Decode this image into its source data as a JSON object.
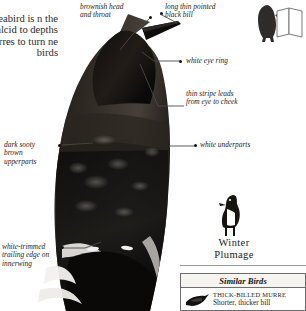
{
  "page": {
    "background": "#ffffff",
    "ink": "#1a1a1a"
  },
  "intro": {
    "text": "seabird is\nn the alcid\nto depths\nmurres\nto turn\nne\nbirds"
  },
  "callouts": [
    {
      "id": "brownish-head",
      "text": "brownish head\nand throat",
      "side": "left"
    },
    {
      "id": "black-bill",
      "text": "long thin pointed\nblack bill",
      "side": "right"
    },
    {
      "id": "white-eye-ring",
      "text": "white eye ring",
      "side": "right"
    },
    {
      "id": "eye-stripe",
      "text": "thin stripe leads\nfrom eye to cheek",
      "side": "right"
    },
    {
      "id": "white-underparts",
      "text": "white underparts",
      "side": "right"
    },
    {
      "id": "dark-upperparts",
      "text": "dark sooty\nbrown\nupperparts",
      "side": "left"
    },
    {
      "id": "white-trimmed",
      "text": "white-trimmed\ntrailing edge on\ninnerwing",
      "side": "left"
    }
  ],
  "winter_plumage": {
    "line1": "Winter",
    "line2": "Plumage"
  },
  "similar_birds": {
    "title": "Similar Birds",
    "entries": [
      {
        "name": "Thick-billed Murre",
        "description": "Shorter, thicker bill"
      }
    ]
  },
  "icons": {
    "corner_bird": "perched-bird-icon",
    "corner_book": "open-book-icon",
    "winter_bird": "standing-murre-icon",
    "similar_bird": "flying-murre-icon",
    "main_bird": "murre-portrait-photo"
  },
  "colors": {
    "bird_dark": "#141414",
    "bird_brown": "#3a332c",
    "label_ink": "#1d1d1d",
    "leader_line": "#4a4a4a",
    "box_border": "#6d6d6d",
    "box_header_bg": "#f6f4ef"
  }
}
